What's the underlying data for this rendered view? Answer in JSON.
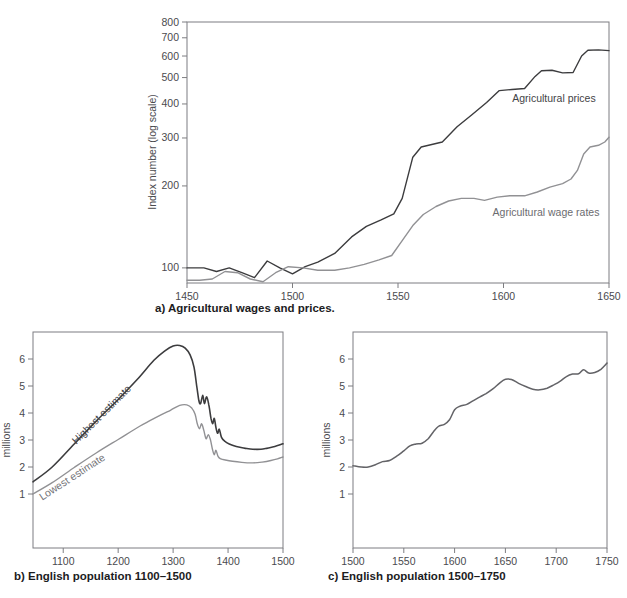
{
  "page": {
    "background_color": "#ffffff"
  },
  "chart_data": [
    {
      "key": "a",
      "type": "line",
      "caption": "a) Agricultural wages and prices.",
      "ylabel": "Index number (log scale)",
      "yscale": "log",
      "ylim": [
        88,
        800
      ],
      "xlim": [
        1450,
        1650
      ],
      "yticks": [
        100,
        200,
        300,
        400,
        500,
        600,
        700,
        800
      ],
      "xticks": [
        1450,
        1500,
        1550,
        1600,
        1650
      ],
      "grid": false,
      "legend_position": "inline-annotations",
      "smooth": false,
      "series": [
        {
          "name": "Agricultural prices",
          "color": "#3c3c3e",
          "points": [
            [
              1450,
              100
            ],
            [
              1458,
              100
            ],
            [
              1464,
              97
            ],
            [
              1470,
              100
            ],
            [
              1476,
              96
            ],
            [
              1482,
              92
            ],
            [
              1488,
              106
            ],
            [
              1494,
              100
            ],
            [
              1500,
              95
            ],
            [
              1506,
              101
            ],
            [
              1512,
              105
            ],
            [
              1520,
              113
            ],
            [
              1528,
              130
            ],
            [
              1535,
              142
            ],
            [
              1542,
              150
            ],
            [
              1548,
              158
            ],
            [
              1552,
              180
            ],
            [
              1557,
              255
            ],
            [
              1561,
              278
            ],
            [
              1566,
              284
            ],
            [
              1571,
              290
            ],
            [
              1578,
              330
            ],
            [
              1585,
              365
            ],
            [
              1592,
              405
            ],
            [
              1598,
              448
            ],
            [
              1604,
              452
            ],
            [
              1610,
              456
            ],
            [
              1615,
              505
            ],
            [
              1618,
              530
            ],
            [
              1623,
              532
            ],
            [
              1628,
              520
            ],
            [
              1633,
              522
            ],
            [
              1637,
              600
            ],
            [
              1640,
              630
            ],
            [
              1645,
              632
            ],
            [
              1650,
              628
            ]
          ]
        },
        {
          "name": "Agricultural wage rates",
          "color": "#919194",
          "points": [
            [
              1450,
              90
            ],
            [
              1456,
              90
            ],
            [
              1462,
              91
            ],
            [
              1468,
              97
            ],
            [
              1474,
              96
            ],
            [
              1480,
              91
            ],
            [
              1486,
              89
            ],
            [
              1492,
              96
            ],
            [
              1498,
              101
            ],
            [
              1505,
              100
            ],
            [
              1512,
              98
            ],
            [
              1520,
              98
            ],
            [
              1527,
              100
            ],
            [
              1534,
              103
            ],
            [
              1541,
              107
            ],
            [
              1547,
              111
            ],
            [
              1552,
              126
            ],
            [
              1557,
              143
            ],
            [
              1562,
              157
            ],
            [
              1568,
              168
            ],
            [
              1574,
              176
            ],
            [
              1580,
              180
            ],
            [
              1586,
              180
            ],
            [
              1591,
              177
            ],
            [
              1597,
              182
            ],
            [
              1603,
              184
            ],
            [
              1610,
              184
            ],
            [
              1616,
              190
            ],
            [
              1622,
              198
            ],
            [
              1628,
              204
            ],
            [
              1632,
              212
            ],
            [
              1635,
              228
            ],
            [
              1638,
              262
            ],
            [
              1641,
              278
            ],
            [
              1645,
              282
            ],
            [
              1648,
              290
            ],
            [
              1650,
              302
            ]
          ]
        }
      ],
      "annotations": [
        "Agricultural prices",
        "Agricultural wage rates"
      ]
    },
    {
      "key": "b",
      "type": "line",
      "caption": "b) English population 1100–1500",
      "ylabel": "millions",
      "yscale": "linear",
      "ylim": [
        -1,
        7
      ],
      "xlim": [
        1045,
        1500
      ],
      "yticks": [
        1,
        2,
        3,
        4,
        5,
        6
      ],
      "xticks": [
        1100,
        1200,
        1300,
        1400,
        1500
      ],
      "grid": false,
      "legend_position": "inline-annotations",
      "smooth": true,
      "series": [
        {
          "name": "Highest estimate",
          "color": "#3c3c3e",
          "points": [
            [
              1045,
              1.45
            ],
            [
              1080,
              2.0
            ],
            [
              1120,
              2.85
            ],
            [
              1160,
              3.7
            ],
            [
              1200,
              4.5
            ],
            [
              1235,
              5.25
            ],
            [
              1265,
              5.95
            ],
            [
              1285,
              6.3
            ],
            [
              1300,
              6.48
            ],
            [
              1312,
              6.5
            ],
            [
              1322,
              6.4
            ],
            [
              1331,
              6.15
            ],
            [
              1338,
              5.7
            ],
            [
              1343,
              5.0
            ],
            [
              1347,
              4.45
            ],
            [
              1350,
              4.35
            ],
            [
              1354,
              4.65
            ],
            [
              1357,
              4.35
            ],
            [
              1361,
              4.6
            ],
            [
              1365,
              4.3
            ],
            [
              1369,
              3.8
            ],
            [
              1372,
              3.6
            ],
            [
              1375,
              3.8
            ],
            [
              1378,
              3.45
            ],
            [
              1381,
              3.25
            ],
            [
              1384,
              3.4
            ],
            [
              1388,
              3.1
            ],
            [
              1394,
              2.95
            ],
            [
              1402,
              2.85
            ],
            [
              1415,
              2.76
            ],
            [
              1430,
              2.7
            ],
            [
              1445,
              2.66
            ],
            [
              1460,
              2.66
            ],
            [
              1472,
              2.7
            ],
            [
              1485,
              2.76
            ],
            [
              1500,
              2.86
            ]
          ]
        },
        {
          "name": "Lowest estimate",
          "color": "#919194",
          "points": [
            [
              1045,
              1.0
            ],
            [
              1080,
              1.42
            ],
            [
              1120,
              1.98
            ],
            [
              1160,
              2.52
            ],
            [
              1200,
              3.02
            ],
            [
              1240,
              3.52
            ],
            [
              1270,
              3.85
            ],
            [
              1295,
              4.1
            ],
            [
              1312,
              4.28
            ],
            [
              1325,
              4.3
            ],
            [
              1334,
              4.18
            ],
            [
              1340,
              3.95
            ],
            [
              1344,
              3.6
            ],
            [
              1348,
              3.42
            ],
            [
              1352,
              3.6
            ],
            [
              1356,
              3.35
            ],
            [
              1360,
              3.05
            ],
            [
              1364,
              3.2
            ],
            [
              1368,
              3.0
            ],
            [
              1372,
              2.62
            ],
            [
              1375,
              2.45
            ],
            [
              1378,
              2.62
            ],
            [
              1382,
              2.38
            ],
            [
              1387,
              2.3
            ],
            [
              1395,
              2.26
            ],
            [
              1408,
              2.21
            ],
            [
              1425,
              2.17
            ],
            [
              1445,
              2.15
            ],
            [
              1462,
              2.18
            ],
            [
              1478,
              2.24
            ],
            [
              1490,
              2.3
            ],
            [
              1500,
              2.37
            ]
          ]
        }
      ],
      "annotations": [
        "Highest estimate",
        "Lowest estimate"
      ]
    },
    {
      "key": "c",
      "type": "line",
      "caption": "c) English population 1500–1750",
      "ylabel": "millions",
      "yscale": "linear",
      "ylim": [
        -1,
        7
      ],
      "xlim": [
        1500,
        1750
      ],
      "yticks": [
        1,
        2,
        3,
        4,
        5,
        6
      ],
      "xticks": [
        1500,
        1550,
        1600,
        1650,
        1700,
        1750
      ],
      "grid": false,
      "legend_position": "none",
      "smooth": true,
      "series": [
        {
          "name": "English population",
          "color": "#636367",
          "points": [
            [
              1500,
              2.05
            ],
            [
              1508,
              2.0
            ],
            [
              1515,
              2.0
            ],
            [
              1522,
              2.08
            ],
            [
              1529,
              2.2
            ],
            [
              1536,
              2.24
            ],
            [
              1543,
              2.4
            ],
            [
              1550,
              2.6
            ],
            [
              1556,
              2.78
            ],
            [
              1562,
              2.85
            ],
            [
              1568,
              2.88
            ],
            [
              1574,
              3.05
            ],
            [
              1579,
              3.3
            ],
            [
              1584,
              3.5
            ],
            [
              1590,
              3.58
            ],
            [
              1595,
              3.75
            ],
            [
              1600,
              4.12
            ],
            [
              1605,
              4.25
            ],
            [
              1612,
              4.32
            ],
            [
              1618,
              4.45
            ],
            [
              1625,
              4.6
            ],
            [
              1631,
              4.72
            ],
            [
              1638,
              4.9
            ],
            [
              1644,
              5.1
            ],
            [
              1650,
              5.25
            ],
            [
              1656,
              5.24
            ],
            [
              1663,
              5.1
            ],
            [
              1670,
              4.98
            ],
            [
              1677,
              4.88
            ],
            [
              1684,
              4.86
            ],
            [
              1691,
              4.92
            ],
            [
              1698,
              5.05
            ],
            [
              1704,
              5.18
            ],
            [
              1710,
              5.35
            ],
            [
              1716,
              5.44
            ],
            [
              1722,
              5.45
            ],
            [
              1727,
              5.6
            ],
            [
              1732,
              5.48
            ],
            [
              1738,
              5.5
            ],
            [
              1744,
              5.62
            ],
            [
              1750,
              5.85
            ]
          ]
        }
      ],
      "annotations": []
    }
  ]
}
